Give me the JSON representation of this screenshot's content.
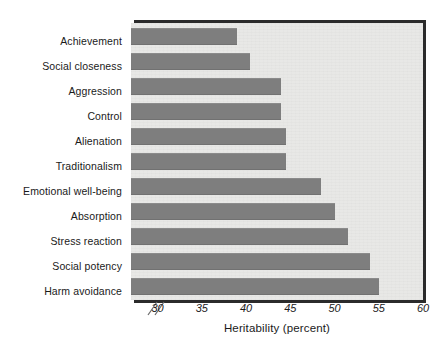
{
  "chart_data": {
    "type": "bar",
    "orientation": "horizontal",
    "title": "",
    "xlabel": "Heritability (percent)",
    "ylabel": "",
    "xlim": [
      27,
      60
    ],
    "axis_break": true,
    "xticks": [
      30,
      35,
      40,
      45,
      50,
      55,
      60
    ],
    "xtick_labels": [
      "30",
      "35",
      "40",
      "45",
      "50",
      "55",
      "60"
    ],
    "grid": false,
    "legend": null,
    "bar_color": "#7e7e7e",
    "plot_background": "#e8e8e6",
    "categories": [
      "Achievement",
      "Social closeness",
      "Aggression",
      "Control",
      "Alienation",
      "Traditionalism",
      "Emotional well-being",
      "Absorption",
      "Stress reaction",
      "Social potency",
      "Harm avoidance"
    ],
    "values": [
      39,
      40.5,
      44,
      44,
      44.5,
      44.5,
      48.5,
      50,
      51.5,
      54,
      55
    ]
  },
  "axis": {
    "title": "Heritability (percent)",
    "break_symbol": "//"
  }
}
